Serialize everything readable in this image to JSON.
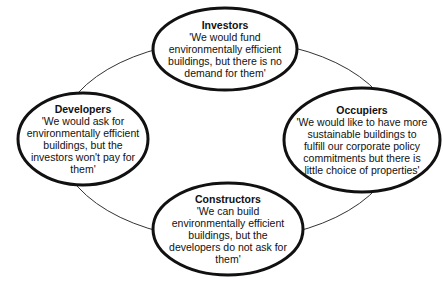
{
  "colors": {
    "stroke": "#111111",
    "connector": "#333333",
    "background": "#ffffff"
  },
  "cycle": {
    "cx": 228,
    "cy": 140,
    "rx": 170,
    "ry": 100
  },
  "nodes": [
    {
      "id": "investors",
      "title": "Investors",
      "quote": "'We would fund environmentally efficient buildings, but there is no demand for them'",
      "cx": 225,
      "cy": 49,
      "rx": 72,
      "ry": 41,
      "text_width": 130
    },
    {
      "id": "developers",
      "title": "Developers",
      "quote": "'We would ask for environmentally efficient buildings, but the investors won't pay for them'",
      "cx": 83,
      "cy": 139,
      "rx": 65,
      "ry": 46,
      "text_width": 118
    },
    {
      "id": "occupiers",
      "title": "Occupiers",
      "quote": "'We would like to have more sustainable buildings to fulfill  our corporate policy commitments but there is little choice of properties'",
      "cx": 362,
      "cy": 140,
      "rx": 78,
      "ry": 52,
      "text_width": 132
    },
    {
      "id": "constructors",
      "title": "Constructors",
      "quote": "'We can build environmentally efficient buildings, but the developers do not ask for them'",
      "cx": 228,
      "cy": 229,
      "rx": 75,
      "ry": 46,
      "text_width": 130
    }
  ]
}
